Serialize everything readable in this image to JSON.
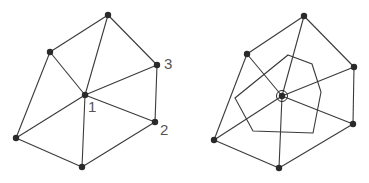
{
  "figures": [
    {
      "name": "triangulation",
      "center": [
        85,
        95
      ],
      "vertices": [
        [
          108,
          15
        ],
        [
          50,
          52
        ],
        [
          157,
          65
        ],
        [
          155,
          122
        ],
        [
          16,
          138
        ],
        [
          82,
          167
        ]
      ],
      "edges": [
        [
          0,
          1
        ],
        [
          0,
          2
        ],
        [
          2,
          3
        ],
        [
          3,
          5
        ],
        [
          5,
          4
        ],
        [
          4,
          1
        ]
      ],
      "labels": [
        {
          "text": "1",
          "x": 88,
          "y": 112
        },
        {
          "text": "2",
          "x": 160,
          "y": 135
        },
        {
          "text": "3",
          "x": 164,
          "y": 69
        }
      ]
    },
    {
      "name": "triangulation-with-dual-cell",
      "center": [
        282,
        96
      ],
      "vertices": [
        [
          304,
          16
        ],
        [
          247,
          54
        ],
        [
          354,
          67
        ],
        [
          353,
          124
        ],
        [
          214,
          140
        ],
        [
          279,
          168
        ]
      ],
      "edges": [
        [
          0,
          1
        ],
        [
          0,
          2
        ],
        [
          2,
          3
        ],
        [
          3,
          5
        ],
        [
          5,
          4
        ],
        [
          4,
          1
        ]
      ],
      "cell_polygon": [
        [
          288,
          55
        ],
        [
          312,
          64
        ],
        [
          321,
          92
        ],
        [
          313,
          133
        ],
        [
          253,
          131
        ],
        [
          235,
          98
        ]
      ],
      "center_marker": "circled-vertex"
    }
  ],
  "style": {
    "line_color": "#3a3a3a",
    "vertex_color": "#2a2a2a",
    "label_color": "#555555"
  }
}
